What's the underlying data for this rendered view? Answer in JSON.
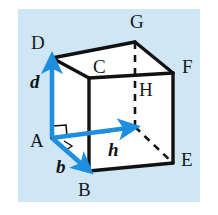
{
  "figure": {
    "background_color": "#ffffff",
    "panel_color": "#cfe7f5",
    "edge_color": "#111111",
    "vector_color": "#1e8ede",
    "label_color": "#16181c",
    "panel": {
      "x": 18,
      "y": 9,
      "width": 182,
      "height": 193
    }
  },
  "cube": {
    "description": "Cube drawn in oblique projection with hidden vertex H shown by dashed edges",
    "vertices": [
      {
        "id": "D",
        "label": "D",
        "x": 52,
        "y": 58,
        "label_x": 31,
        "label_y": 33,
        "hidden": false
      },
      {
        "id": "G",
        "label": "G",
        "x": 135,
        "y": 42,
        "label_x": 130,
        "label_y": 12,
        "hidden": false
      },
      {
        "id": "C",
        "label": "C",
        "x": 89,
        "y": 78,
        "label_x": 93,
        "label_y": 57,
        "hidden": false
      },
      {
        "id": "F",
        "label": "F",
        "x": 173,
        "y": 73,
        "label_x": 182,
        "label_y": 57,
        "hidden": false
      },
      {
        "id": "A",
        "label": "A",
        "x": 52,
        "y": 138,
        "label_x": 30,
        "label_y": 131,
        "hidden": false
      },
      {
        "id": "B",
        "label": "B",
        "x": 89,
        "y": 171,
        "label_x": 78,
        "label_y": 180,
        "hidden": false
      },
      {
        "id": "H",
        "label": "H",
        "x": 135,
        "y": 127,
        "label_x": 139,
        "label_y": 80,
        "hidden": true
      },
      {
        "id": "E",
        "label": "E",
        "x": 173,
        "y": 163,
        "label_x": 181,
        "label_y": 150,
        "hidden": false
      }
    ],
    "solid_edges": [
      [
        "D",
        "G"
      ],
      [
        "G",
        "F"
      ],
      [
        "F",
        "C"
      ],
      [
        "C",
        "D"
      ],
      [
        "D",
        "A"
      ],
      [
        "C",
        "B"
      ],
      [
        "F",
        "E"
      ],
      [
        "A",
        "B"
      ],
      [
        "B",
        "E"
      ]
    ],
    "dashed_edges": [
      [
        "G",
        "H"
      ],
      [
        "H",
        "E"
      ],
      [
        "H",
        "A"
      ]
    ]
  },
  "vectors": [
    {
      "id": "d",
      "label": "d",
      "from": "A",
      "to": "D",
      "label_x": 30,
      "label_y": 72,
      "color": "#1e8ede"
    },
    {
      "id": "b",
      "label": "b",
      "from": "A",
      "to": "B",
      "label_x": 56,
      "label_y": 157,
      "color": "#1e8ede"
    },
    {
      "id": "h",
      "label": "h",
      "from": "A",
      "to": "H",
      "label_x": 108,
      "label_y": 140,
      "color": "#1e8ede"
    }
  ],
  "angle_marks": [
    {
      "id": "right-angle-d-h",
      "type": "square",
      "at": "A",
      "between": [
        "d",
        "h"
      ]
    },
    {
      "id": "right-angle-b-h",
      "type": "arc",
      "at": "A",
      "between": [
        "b",
        "h"
      ]
    }
  ]
}
